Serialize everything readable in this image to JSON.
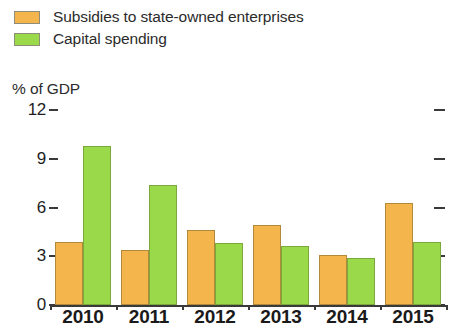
{
  "chart_data": {
    "type": "bar",
    "title": "",
    "subtitle": "",
    "xlabel": "",
    "ylabel": "% of GDP",
    "categories": [
      "2010",
      "2011",
      "2012",
      "2013",
      "2014",
      "2015"
    ],
    "series": [
      {
        "name": "Subsidies to state-owned enterprises",
        "color": "#f5b54d",
        "values": [
          3.9,
          3.4,
          4.6,
          4.9,
          3.1,
          6.3
        ]
      },
      {
        "name": "Capital spending",
        "color": "#9ada4a",
        "values": [
          9.8,
          7.4,
          3.8,
          3.6,
          2.9,
          3.9
        ]
      }
    ],
    "ylim": [
      0,
      12
    ],
    "yticks": [
      0,
      3,
      6,
      9,
      12
    ],
    "ytick_labels": [
      "0",
      "3",
      "6",
      "9",
      "12"
    ],
    "grid": false,
    "legend_position": "top-left",
    "right_axis_ticks": true
  },
  "legend": {
    "items": [
      {
        "label": "Subsidies to state-owned enterprises",
        "swatch": "orange"
      },
      {
        "label": "Capital spending",
        "swatch": "green"
      }
    ]
  },
  "axis": {
    "unit_label": "% of GDP"
  }
}
